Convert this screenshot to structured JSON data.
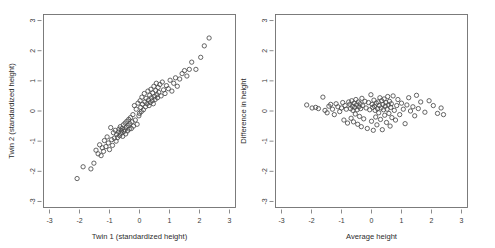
{
  "figure": {
    "background": "#ffffff",
    "panel_count": 2,
    "marker": "open-circle",
    "marker_color": "#4a4a4a",
    "frame_color": "#6e6e6e"
  },
  "chart_data": [
    {
      "type": "scatter",
      "panel": "left",
      "title": "",
      "xlabel": "Twin 1 (standardized height)",
      "ylabel": "Twin 2 (standardized height)",
      "xlim": [
        -3.2,
        3.2
      ],
      "ylim": [
        -3.2,
        3.2
      ],
      "xticks": [
        -3,
        -2,
        -1,
        0,
        1,
        2,
        3
      ],
      "yticks": [
        -3,
        -2,
        -1,
        0,
        1,
        2,
        3
      ],
      "xticklabels": [
        "-3",
        "-2",
        "-1",
        "0",
        "1",
        "2",
        "3"
      ],
      "yticklabels": [
        "-3",
        "-2",
        "-1",
        "0",
        "1",
        "2",
        "3"
      ],
      "grid": false,
      "legend": false,
      "n_points": 108,
      "x": [
        -2.08,
        -1.88,
        -1.62,
        -1.52,
        -1.45,
        -1.38,
        -1.33,
        -1.28,
        -1.24,
        -1.2,
        -1.17,
        -1.12,
        -1.08,
        -1.04,
        -1.0,
        -0.96,
        -0.93,
        -0.9,
        -0.87,
        -0.84,
        -0.81,
        -0.78,
        -0.76,
        -0.73,
        -0.7,
        -0.68,
        -0.66,
        -0.64,
        -0.62,
        -0.6,
        -0.58,
        -0.56,
        -0.54,
        -0.52,
        -0.5,
        -0.48,
        -0.46,
        -0.44,
        -0.42,
        -0.4,
        -0.38,
        -0.36,
        -0.34,
        -0.32,
        -0.3,
        -0.27,
        -0.25,
        -0.22,
        -0.2,
        -0.17,
        -0.14,
        -0.11,
        -0.08,
        -0.05,
        -0.02,
        0.0,
        0.02,
        0.04,
        0.06,
        0.08,
        0.1,
        0.13,
        0.16,
        0.18,
        0.2,
        0.22,
        0.25,
        0.28,
        0.3,
        0.32,
        0.34,
        0.36,
        0.38,
        0.4,
        0.42,
        0.44,
        0.46,
        0.48,
        0.5,
        0.52,
        0.54,
        0.56,
        0.58,
        0.6,
        0.62,
        0.64,
        0.68,
        0.72,
        0.76,
        0.8,
        0.85,
        0.9,
        0.96,
        1.02,
        1.08,
        1.14,
        1.2,
        1.26,
        1.34,
        1.42,
        1.5,
        1.58,
        1.66,
        1.74,
        1.88,
        2.04,
        2.16,
        2.32
      ],
      "y": [
        -2.24,
        -1.85,
        -1.92,
        -1.73,
        -1.3,
        -1.42,
        -1.12,
        -1.48,
        -1.22,
        -1.34,
        -0.98,
        -1.18,
        -0.86,
        -1.06,
        -1.28,
        -0.55,
        -0.95,
        -1.14,
        -0.72,
        -0.9,
        -0.64,
        -1.0,
        -0.78,
        -0.88,
        -0.7,
        -0.6,
        -0.82,
        -0.52,
        -0.74,
        -0.66,
        -0.58,
        -0.84,
        -0.46,
        -0.68,
        -0.62,
        -0.4,
        -0.76,
        -0.54,
        -0.34,
        -0.66,
        -0.48,
        -0.28,
        -0.6,
        -0.42,
        -0.22,
        -0.58,
        -0.36,
        -0.12,
        -0.5,
        0.18,
        -0.3,
        0.06,
        -0.44,
        0.26,
        -0.16,
        -0.08,
        0.34,
        0.12,
        -0.02,
        0.46,
        0.22,
        0.04,
        0.58,
        0.3,
        0.14,
        0.42,
        0.24,
        0.66,
        0.36,
        0.18,
        0.52,
        0.28,
        0.72,
        0.44,
        0.34,
        0.6,
        0.24,
        0.82,
        0.48,
        0.38,
        0.68,
        0.92,
        0.54,
        0.44,
        0.78,
        0.62,
        0.88,
        0.5,
        0.96,
        0.7,
        0.58,
        0.84,
        0.74,
        1.02,
        0.66,
        0.92,
        1.1,
        0.82,
        1.06,
        1.24,
        1.34,
        1.16,
        1.38,
        1.62,
        1.38,
        1.78,
        2.16,
        2.42
      ]
    },
    {
      "type": "scatter",
      "panel": "right",
      "title": "",
      "xlabel": "Average height",
      "ylabel": "Difference in height",
      "xlim": [
        -3.2,
        3.2
      ],
      "ylim": [
        -3.2,
        3.2
      ],
      "xticks": [
        -3,
        -2,
        -1,
        0,
        1,
        2,
        3
      ],
      "yticks": [
        -3,
        -2,
        -1,
        0,
        1,
        2,
        3
      ],
      "xticklabels": [
        "-3",
        "-2",
        "-1",
        "0",
        "1",
        "2",
        "3"
      ],
      "yticklabels": [
        "-3",
        "-2",
        "-1",
        "0",
        "1",
        "2",
        "3"
      ],
      "grid": false,
      "legend": false,
      "n_points": 108,
      "x": [
        -2.16,
        -1.98,
        -1.86,
        -1.77,
        -1.62,
        -1.55,
        -1.48,
        -1.42,
        -1.36,
        -1.3,
        -1.24,
        -1.18,
        -1.12,
        -1.06,
        -1.0,
        -0.96,
        -0.92,
        -0.88,
        -0.84,
        -0.8,
        -0.76,
        -0.72,
        -0.7,
        -0.68,
        -0.66,
        -0.64,
        -0.62,
        -0.6,
        -0.58,
        -0.56,
        -0.54,
        -0.52,
        -0.5,
        -0.48,
        -0.46,
        -0.44,
        -0.42,
        -0.4,
        -0.38,
        -0.36,
        -0.34,
        -0.32,
        -0.3,
        -0.26,
        -0.22,
        -0.18,
        -0.14,
        -0.1,
        -0.06,
        -0.02,
        0.0,
        0.02,
        0.04,
        0.06,
        0.08,
        0.1,
        0.12,
        0.14,
        0.16,
        0.18,
        0.2,
        0.22,
        0.24,
        0.26,
        0.28,
        0.3,
        0.32,
        0.34,
        0.36,
        0.38,
        0.4,
        0.42,
        0.44,
        0.46,
        0.48,
        0.5,
        0.52,
        0.54,
        0.56,
        0.58,
        0.6,
        0.62,
        0.64,
        0.66,
        0.68,
        0.72,
        0.76,
        0.8,
        0.84,
        0.88,
        0.94,
        1.0,
        1.06,
        1.12,
        1.18,
        1.24,
        1.3,
        1.38,
        1.44,
        1.5,
        1.56,
        1.64,
        1.78,
        1.92,
        2.06,
        2.2,
        2.32,
        2.4
      ],
      "y": [
        0.2,
        0.1,
        0.12,
        0.08,
        0.46,
        0.02,
        -0.06,
        0.16,
        0.22,
        0.06,
        -0.12,
        0.24,
        0.14,
        -0.02,
        0.1,
        0.28,
        -0.3,
        0.18,
        0.06,
        -0.4,
        0.3,
        0.22,
        0.08,
        -0.24,
        0.34,
        0.16,
        0.02,
        -0.36,
        0.26,
        0.12,
        -0.1,
        0.38,
        0.2,
        0.04,
        -0.44,
        0.3,
        0.14,
        -0.18,
        0.24,
        0.08,
        -0.52,
        0.42,
        0.18,
        -0.26,
        0.32,
        0.1,
        -0.58,
        0.28,
        0.04,
        0.54,
        -0.34,
        0.22,
        0.12,
        -0.64,
        0.36,
        0.16,
        0.02,
        -0.2,
        0.26,
        -0.46,
        0.08,
        0.3,
        -0.06,
        0.18,
        0.44,
        -0.28,
        0.1,
        0.34,
        -0.62,
        0.22,
        0.04,
        0.4,
        -0.14,
        0.16,
        0.28,
        -0.38,
        0.06,
        0.48,
        0.2,
        -0.08,
        0.32,
        -0.5,
        0.12,
        0.24,
        -0.22,
        0.5,
        0.02,
        -0.3,
        0.18,
        0.38,
        -0.12,
        0.26,
        0.06,
        -0.42,
        0.2,
        0.44,
        0.0,
        0.14,
        -0.16,
        0.52,
        0.08,
        0.3,
        -0.04,
        0.34,
        0.18,
        -0.08,
        0.1,
        -0.12
      ]
    }
  ]
}
